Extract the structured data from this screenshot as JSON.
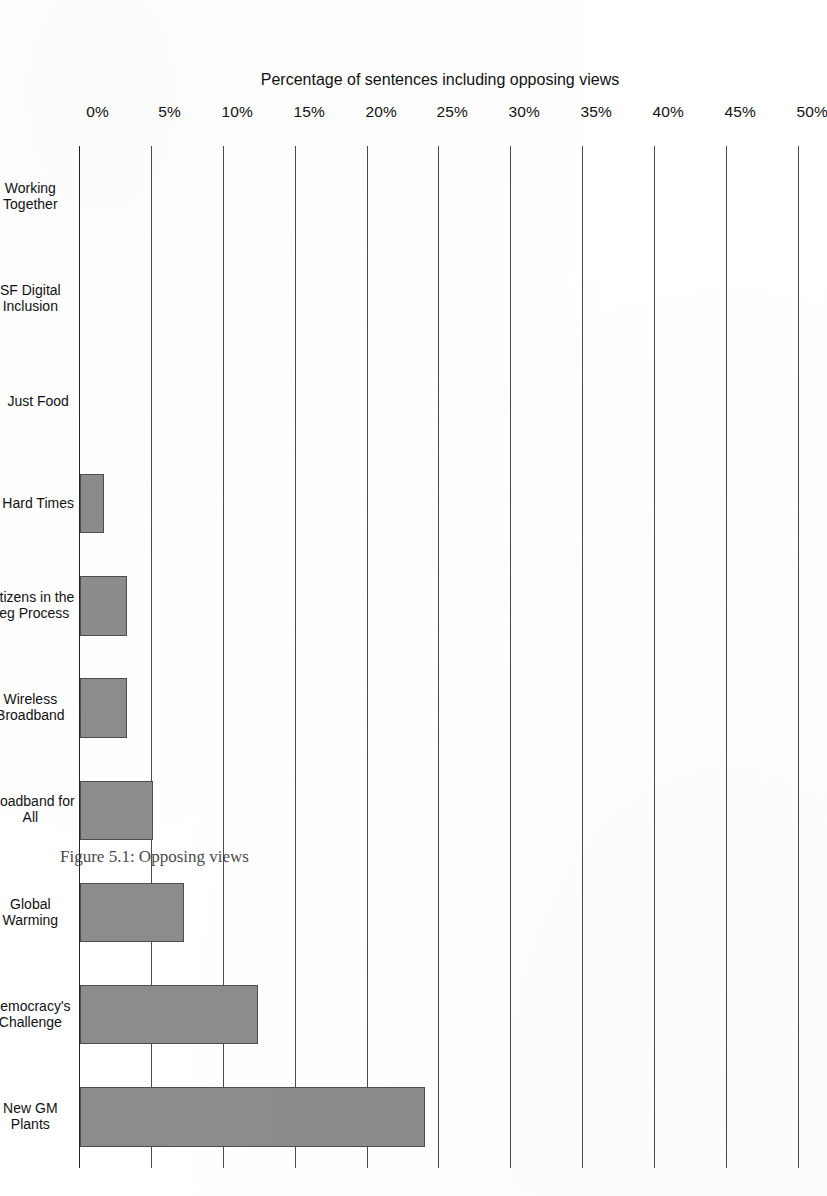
{
  "chart_data": {
    "type": "bar",
    "orientation": "horizontal-on-rotated-page",
    "title": "",
    "xlabel": "",
    "ylabel": "Percentage of sentences including opposing views",
    "categories": [
      "Working Together",
      "SF Digital Inclusion",
      "Just Food",
      "Hard Times",
      "Citizens in the Leg Process",
      "Wireless Broadband",
      "Broadband for All",
      "Global Warming",
      "Democracy's Challenge",
      "New GM Plants"
    ],
    "category_lines": [
      [
        "Working",
        "Together"
      ],
      [
        "SF Digital",
        "Inclusion"
      ],
      [
        "Just Food",
        ""
      ],
      [
        "Hard Times",
        ""
      ],
      [
        "Citizens in the",
        "Leg Process"
      ],
      [
        "Wireless",
        "Broadband"
      ],
      [
        "Broadband for",
        "All"
      ],
      [
        "Global",
        "Warming"
      ],
      [
        "Democracy's",
        "Challenge"
      ],
      [
        "New GM",
        "Plants"
      ]
    ],
    "values": [
      0,
      0,
      0,
      1.7,
      3.3,
      3.3,
      5.1,
      7.2,
      12.4,
      24.0
    ],
    "tick_labels": [
      "0%",
      "5%",
      "10%",
      "15%",
      "20%",
      "25%",
      "30%",
      "35%",
      "40%",
      "45%",
      "50%"
    ],
    "tick_values": [
      0,
      5,
      10,
      15,
      20,
      25,
      30,
      35,
      40,
      45,
      50
    ],
    "ylim": [
      0,
      50
    ],
    "grid": true,
    "legend": "none",
    "bar_fill_color": "#8c8c8c",
    "bar_edge_color": "#4d4d4d",
    "axis_color": "#4a4a4a",
    "background_color": "#ffffff"
  },
  "figure": {
    "caption": "Figure 5.1: Opposing views"
  }
}
